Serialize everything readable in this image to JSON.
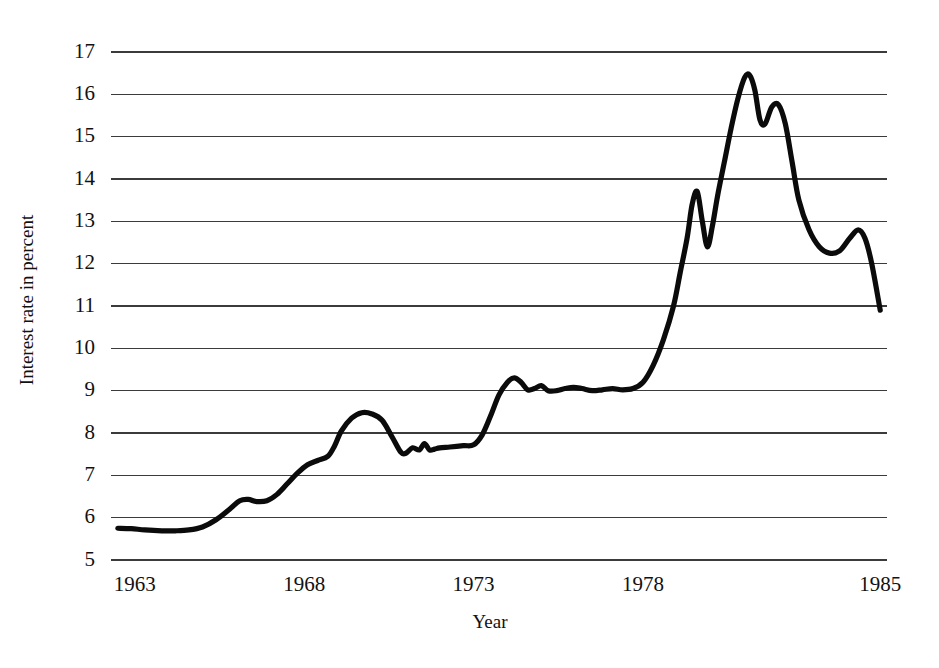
{
  "chart_data": {
    "type": "line",
    "title": "",
    "subtitle": "",
    "xlabel": "Year",
    "ylabel": "Interest rate in percent",
    "grid": true,
    "legend": null,
    "legend_position": "none",
    "xlim": [
      1962.3,
      1985.2
    ],
    "ylim": [
      5,
      17
    ],
    "xticks": [
      "1963",
      "1968",
      "1973",
      "1978",
      "1985"
    ],
    "xtick_values": [
      1963,
      1968,
      1973,
      1978,
      1985
    ],
    "yticks": [
      "5",
      "6",
      "7",
      "8",
      "9",
      "10",
      "11",
      "12",
      "13",
      "14",
      "15",
      "16",
      "17"
    ],
    "ytick_values": [
      5,
      6,
      7,
      8,
      9,
      10,
      11,
      12,
      13,
      14,
      15,
      16,
      17
    ],
    "line_color": "#0b0b0b",
    "grid_color": "#3b3b3b",
    "series": [
      {
        "name": "Interest rate",
        "x": [
          1962.5,
          1962.9,
          1963.3,
          1963.8,
          1964.2,
          1964.6,
          1965.0,
          1965.4,
          1965.8,
          1966.1,
          1966.35,
          1966.6,
          1966.9,
          1967.2,
          1967.5,
          1967.8,
          1968.1,
          1968.4,
          1968.7,
          1968.9,
          1969.1,
          1969.4,
          1969.7,
          1970.0,
          1970.3,
          1970.6,
          1970.85,
          1971.0,
          1971.2,
          1971.4,
          1971.55,
          1971.7,
          1971.85,
          1972.0,
          1972.3,
          1972.7,
          1973.0,
          1973.25,
          1973.5,
          1973.75,
          1974.0,
          1974.2,
          1974.4,
          1974.6,
          1974.8,
          1975.0,
          1975.2,
          1975.45,
          1975.7,
          1975.95,
          1976.2,
          1976.5,
          1976.8,
          1977.1,
          1977.4,
          1977.7,
          1978.0,
          1978.3,
          1978.6,
          1978.9,
          1979.1,
          1979.3,
          1979.45,
          1979.6,
          1979.75,
          1979.9,
          1980.05,
          1980.2,
          1980.4,
          1980.6,
          1980.8,
          1981.0,
          1981.15,
          1981.3,
          1981.45,
          1981.6,
          1981.8,
          1982.0,
          1982.2,
          1982.4,
          1982.6,
          1982.9,
          1983.2,
          1983.5,
          1983.8,
          1984.1,
          1984.35,
          1984.55,
          1984.75,
          1985.0
        ],
        "y": [
          5.75,
          5.74,
          5.71,
          5.69,
          5.69,
          5.71,
          5.78,
          5.95,
          6.2,
          6.4,
          6.43,
          6.38,
          6.4,
          6.55,
          6.8,
          7.05,
          7.25,
          7.35,
          7.45,
          7.7,
          8.05,
          8.35,
          8.48,
          8.45,
          8.3,
          7.9,
          7.55,
          7.52,
          7.65,
          7.6,
          7.75,
          7.6,
          7.62,
          7.65,
          7.67,
          7.7,
          7.72,
          7.95,
          8.4,
          8.9,
          9.2,
          9.3,
          9.2,
          9.02,
          9.05,
          9.12,
          9.0,
          9.0,
          9.05,
          9.08,
          9.05,
          9.0,
          9.02,
          9.05,
          9.02,
          9.05,
          9.2,
          9.6,
          10.2,
          11.0,
          11.8,
          12.6,
          13.4,
          13.7,
          13.0,
          12.4,
          12.9,
          13.6,
          14.4,
          15.2,
          15.9,
          16.4,
          16.45,
          16.1,
          15.4,
          15.3,
          15.7,
          15.75,
          15.3,
          14.4,
          13.5,
          12.8,
          12.4,
          12.25,
          12.3,
          12.6,
          12.8,
          12.6,
          12.0,
          10.9
        ],
        "start_value": 5.75,
        "end_value": 10.9,
        "max_value": 16.45,
        "max_year": 1981.15,
        "min_value": 5.69,
        "min_year": 1964.2
      }
    ],
    "annotations": []
  },
  "axes": {
    "y_title": "Interest rate in percent",
    "x_title": "Year"
  }
}
